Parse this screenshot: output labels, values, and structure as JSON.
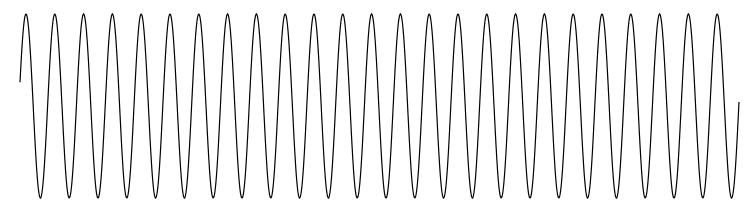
{
  "chart_data": {
    "type": "line",
    "title": "",
    "xlabel": "",
    "ylabel": "",
    "grid": false,
    "legend": null,
    "series": [
      {
        "name": "waveform",
        "function": "sine",
        "cycles": 25,
        "amplitude": 1.0,
        "start_phase_deg": 0,
        "end_phase_deg": 20,
        "color": "#000000"
      }
    ],
    "pixel_geometry": {
      "x_start": 20,
      "x_end": 739,
      "y_center": 106,
      "y_peak": 14,
      "y_trough": 198,
      "first_peak_x": 26,
      "last_peak_x": 717,
      "period_px": 28.8
    }
  }
}
